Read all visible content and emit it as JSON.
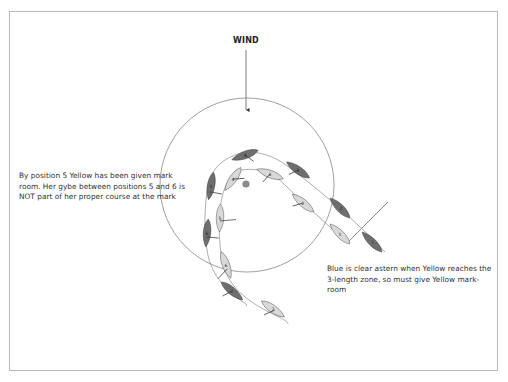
{
  "wind_label": "WIND",
  "notes": {
    "left": "By position 5 Yellow has been given mark room. Her gybe between positions 5 and 6 is NOT part of her proper course at the mark",
    "right": "Blue is clear astern when Yellow reaches the 3-length zone, so must give Yellow mark-room"
  },
  "colors": {
    "blue_boat": "#6e6e6e",
    "yellow_boat": "#d9d9d9",
    "mark": "#8a8a8a",
    "zone_circle": "#777777",
    "frame": "#b8b8b8"
  },
  "boats": {
    "blue": [
      {
        "position": "1",
        "x": 372,
        "y": 242
      },
      {
        "position": "2",
        "x": 340,
        "y": 208
      },
      {
        "position": "3",
        "x": 297,
        "y": 170
      },
      {
        "position": "4",
        "x": 245,
        "y": 155
      },
      {
        "position": "5",
        "x": 211,
        "y": 185
      },
      {
        "position": "6",
        "x": 207,
        "y": 233
      },
      {
        "position": "7",
        "x": 232,
        "y": 291
      }
    ],
    "yellow": [
      {
        "position": "1",
        "x": 340,
        "y": 234
      },
      {
        "position": "2",
        "x": 303,
        "y": 203
      },
      {
        "position": "3",
        "x": 270,
        "y": 174
      },
      {
        "position": "4",
        "x": 233,
        "y": 179
      },
      {
        "position": "5",
        "x": 220,
        "y": 218
      },
      {
        "position": "6",
        "x": 226,
        "y": 265
      },
      {
        "position": "7",
        "x": 273,
        "y": 309
      }
    ]
  }
}
